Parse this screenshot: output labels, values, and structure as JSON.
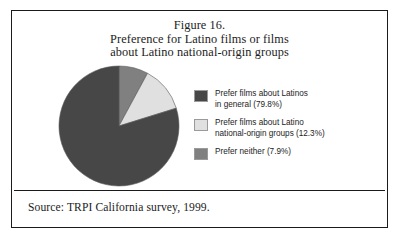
{
  "figure": {
    "title_lines": [
      "Figure 16.",
      "Preference for Latino films or films",
      "about Latino national-origin groups"
    ],
    "source_note": "Source: TRPI California survey, 1999."
  },
  "legend": {
    "items": [
      {
        "swatch_color": "#474747",
        "lines": [
          "Prefer films about Latinos",
          "in general (79.8%)"
        ]
      },
      {
        "swatch_color": "#e0e0e0",
        "lines": [
          "Prefer films about Latino",
          "national-origin groups (12.3%)"
        ]
      },
      {
        "swatch_color": "#808080",
        "lines": [
          "Prefer neither (7.9%)"
        ]
      }
    ]
  },
  "chart_data": {
    "type": "pie",
    "title": "Preference for Latino films or films about Latino national-origin groups",
    "labels": [
      "Prefer films about Latinos in general",
      "Prefer films about Latino national-origin groups",
      "Prefer neither"
    ],
    "values": [
      79.8,
      12.3,
      7.9
    ],
    "colors": [
      "#474747",
      "#e0e0e0",
      "#808080"
    ],
    "units": "percent",
    "start_angle_deg": 0,
    "direction": "clockwise",
    "draw_order": [
      "Prefer neither",
      "Prefer films about Latino national-origin groups",
      "Prefer films about Latinos in general"
    ],
    "legend_position": "right",
    "grid": false,
    "xlabel": "",
    "ylabel": ""
  }
}
